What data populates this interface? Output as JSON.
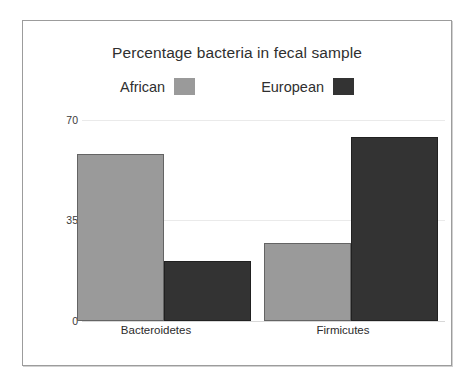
{
  "chart_data": {
    "type": "bar",
    "title": "Percentage bacteria in fecal sample",
    "xlabel": "",
    "ylabel": "",
    "categories": [
      "Bacteroidetes",
      "Firmicutes"
    ],
    "series": [
      {
        "name": "African",
        "values": [
          58,
          27
        ],
        "color": "#9a9a9a"
      },
      {
        "name": "European",
        "values": [
          21,
          64
        ],
        "color": "#333333"
      }
    ],
    "ylim": [
      0,
      70
    ],
    "yticks": [
      0,
      35,
      70
    ],
    "ytick_labels": [
      "0",
      "35",
      "70"
    ],
    "grid": true,
    "legend_position": "top"
  },
  "frame": {
    "border_color": "#9c9c9c",
    "background": "#ffffff"
  },
  "legend": {
    "items": [
      {
        "label": "African",
        "swatch_color": "#9a9a9a"
      },
      {
        "label": "European",
        "swatch_color": "#333333"
      }
    ]
  }
}
